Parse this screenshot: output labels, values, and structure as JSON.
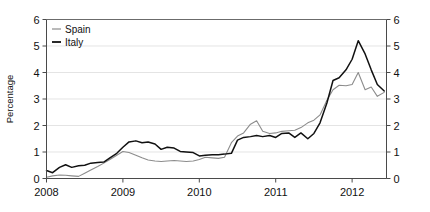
{
  "chart_data": {
    "type": "line",
    "title": "",
    "subtitle": "",
    "xlabel": "",
    "ylabel": "Percentage",
    "ylabel_right": "",
    "xlim": [
      2008.0,
      2012.45
    ],
    "ylim": [
      0,
      6
    ],
    "yticks": [
      0,
      1,
      2,
      3,
      4,
      5,
      6
    ],
    "ytick_labels": [
      "0",
      "1",
      "2",
      "3",
      "4",
      "5",
      "6"
    ],
    "yticks_right": [
      0,
      1,
      2,
      3,
      4,
      5,
      6
    ],
    "ytick_labels_right": [
      "0",
      "1",
      "2",
      "3",
      "4",
      "5",
      "6"
    ],
    "xticks": [
      2008,
      2009,
      2010,
      2011,
      2012
    ],
    "xtick_labels": [
      "2008",
      "2009",
      "2010",
      "2011",
      "2012"
    ],
    "grid": true,
    "grid_axis": "y",
    "legend_position": "top-left",
    "x": [
      2008.0,
      2008.08,
      2008.17,
      2008.25,
      2008.33,
      2008.42,
      2008.5,
      2008.58,
      2008.67,
      2008.75,
      2008.83,
      2008.92,
      2009.0,
      2009.08,
      2009.17,
      2009.25,
      2009.33,
      2009.42,
      2009.5,
      2009.58,
      2009.67,
      2009.75,
      2009.83,
      2009.92,
      2010.0,
      2010.08,
      2010.17,
      2010.25,
      2010.33,
      2010.42,
      2010.5,
      2010.58,
      2010.67,
      2010.75,
      2010.83,
      2010.92,
      2011.0,
      2011.08,
      2011.17,
      2011.25,
      2011.33,
      2011.42,
      2011.5,
      2011.58,
      2011.67,
      2011.75,
      2011.83,
      2011.92,
      2012.0,
      2012.08,
      2012.17,
      2012.25,
      2012.33,
      2012.42
    ],
    "series": [
      {
        "name": "Spain",
        "color": "#8c8c8c",
        "linewidth": 1.1,
        "values": [
          0.05,
          0.1,
          0.13,
          0.12,
          0.1,
          0.08,
          0.2,
          0.32,
          0.45,
          0.58,
          0.72,
          0.88,
          1.02,
          0.98,
          0.88,
          0.78,
          0.7,
          0.66,
          0.64,
          0.66,
          0.68,
          0.66,
          0.64,
          0.66,
          0.72,
          0.8,
          0.78,
          0.76,
          0.8,
          1.35,
          1.6,
          1.72,
          2.05,
          2.18,
          1.78,
          1.7,
          1.72,
          1.78,
          1.8,
          1.82,
          1.92,
          2.1,
          2.2,
          2.4,
          2.95,
          3.35,
          3.52,
          3.5,
          3.55,
          4.0,
          3.35,
          3.45,
          3.1,
          3.25
        ]
      },
      {
        "name": "Italy",
        "color": "#111111",
        "linewidth": 1.5,
        "values": [
          0.3,
          0.22,
          0.42,
          0.52,
          0.42,
          0.48,
          0.5,
          0.58,
          0.6,
          0.62,
          0.78,
          0.95,
          1.18,
          1.38,
          1.42,
          1.35,
          1.38,
          1.3,
          1.1,
          1.18,
          1.15,
          1.02,
          1.0,
          0.98,
          0.85,
          0.88,
          0.9,
          0.9,
          0.92,
          0.95,
          1.45,
          1.55,
          1.58,
          1.62,
          1.58,
          1.62,
          1.55,
          1.7,
          1.72,
          1.55,
          1.72,
          1.5,
          1.7,
          2.1,
          2.85,
          3.7,
          3.8,
          4.1,
          4.5,
          5.2,
          4.7,
          4.1,
          3.55,
          3.3
        ]
      }
    ]
  },
  "legend": {
    "items": [
      {
        "label": "Spain",
        "color": "#8c8c8c"
      },
      {
        "label": "Italy",
        "color": "#111111"
      }
    ]
  },
  "axes": {
    "ylabel": "Percentage"
  }
}
